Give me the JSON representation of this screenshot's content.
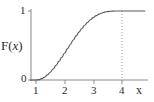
{
  "figure": {
    "background_color": "#ffffff",
    "axis_color": "#8a8a8a",
    "curve_color": "#5a5a5a",
    "text_color": "#2b2b2b",
    "dotted_line_color": "#9a9a9a"
  },
  "labels": {
    "y_axis_title": "F(",
    "y_axis_title_var": "x",
    "y_axis_title_end": ")",
    "x_axis_title": "x",
    "y_tick_top": "1",
    "y_tick_zero": "0",
    "x_tick_1": "1",
    "x_tick_2": "2",
    "x_tick_3": "3",
    "x_tick_4": "4"
  },
  "chart_data": {
    "type": "line",
    "title": "",
    "xlabel": "x",
    "ylabel": "F(x)",
    "xlim": [
      0.6,
      4.8
    ],
    "ylim": [
      0,
      1.08
    ],
    "xticks": [
      1,
      2,
      3,
      4
    ],
    "xticklabels": [
      "1",
      "2",
      "3",
      "4"
    ],
    "yticks": [
      0,
      1
    ],
    "yticklabels": [
      "0",
      "1"
    ],
    "grid": false,
    "legend": null,
    "annotations": [
      {
        "type": "dotted_vertical_line",
        "x": 4,
        "y_from": 0,
        "y_to": 1,
        "style": "dotted"
      }
    ],
    "series": [
      {
        "name": "F(x)",
        "description": "cumulative distribution function, S-shaped, 0 for x<=1, rising to 1 at x=4, constant 1 for x>=4",
        "x": [
          0.6,
          0.8,
          1.0,
          1.1,
          1.2,
          1.3,
          1.4,
          1.5,
          1.6,
          1.7,
          1.8,
          1.9,
          2.0,
          2.1,
          2.2,
          2.3,
          2.4,
          2.5,
          2.6,
          2.7,
          2.8,
          2.9,
          3.0,
          3.1,
          3.2,
          3.3,
          3.4,
          3.5,
          3.6,
          3.7,
          3.8,
          3.9,
          4.0,
          4.2,
          4.4,
          4.6,
          4.8
        ],
        "y": [
          0.0,
          0.0,
          0.0,
          0.005,
          0.019,
          0.042,
          0.074,
          0.113,
          0.16,
          0.212,
          0.269,
          0.329,
          0.392,
          0.455,
          0.518,
          0.58,
          0.639,
          0.695,
          0.747,
          0.794,
          0.836,
          0.873,
          0.905,
          0.932,
          0.954,
          0.971,
          0.984,
          0.992,
          0.997,
          0.999,
          1.0,
          1.0,
          1.0,
          1.0,
          1.0,
          1.0,
          1.0
        ]
      }
    ]
  }
}
